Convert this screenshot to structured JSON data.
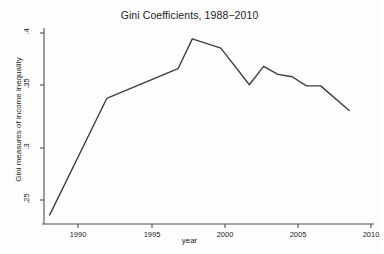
{
  "chart_data": {
    "type": "line",
    "title": "Gini Coefficients, 1988−2010",
    "xlabel": "year",
    "ylabel": "Gini measures of income inequality",
    "xlim": [
      1987.6,
      2010.6
    ],
    "ylim": [
      0.2375,
      0.4015
    ],
    "grid": false,
    "legend": null,
    "x_ticks": [
      1990,
      1995,
      2000,
      2005,
      2010
    ],
    "x_tick_labels": [
      "1990",
      "1995",
      "2000",
      "2005",
      "2010"
    ],
    "y_ticks": [
      0.25,
      0.3,
      0.35,
      0.4
    ],
    "y_tick_labels": [
      ".25",
      ".3",
      ".35",
      ".4"
    ],
    "line_color": "#3b3b3b",
    "axis_color": "#4f4f4f",
    "background_color": "#fdfdfd",
    "series": [
      {
        "name": "Gini coefficient",
        "x": [
          1988,
          1992,
          1997,
          1998,
          2000,
          2002,
          2003,
          2004,
          2005,
          2006,
          2007,
          2009
        ],
        "values": [
          0.242,
          0.3435,
          0.3695,
          0.3955,
          0.3875,
          0.3555,
          0.3715,
          0.3645,
          0.3625,
          0.3545,
          0.3545,
          0.333
        ]
      }
    ]
  },
  "geometry": {
    "plot_left": 44,
    "plot_right": 372,
    "plot_top": 32,
    "plot_bottom": 220,
    "x_tick_px": [
      78,
      152,
      225,
      298,
      371
    ],
    "y_tick_px": [
      200,
      148,
      85,
      33
    ]
  }
}
